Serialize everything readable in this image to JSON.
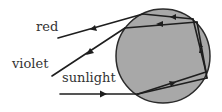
{
  "diagram": {
    "labels": {
      "red": "red",
      "violet": "violet",
      "sunlight": "sunlight"
    },
    "colors": {
      "droplet_fill": "#a8a8a8",
      "droplet_stroke": "#2a2a2a",
      "ray": "#1e1e1e",
      "text": "#333333",
      "background": "#ffffff"
    },
    "droplet": {
      "cx": 163,
      "cy": 56,
      "r": 47
    }
  }
}
